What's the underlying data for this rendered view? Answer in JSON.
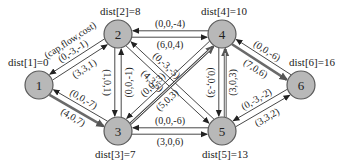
{
  "legend": {
    "label": "(cap,flow,cost)"
  },
  "nodes": [
    {
      "id": "1",
      "label": "1",
      "x": 39,
      "y": 85,
      "dist": "dist[1]=0",
      "dist_x": 8,
      "dist_y": 66
    },
    {
      "id": "2",
      "label": "2",
      "x": 118,
      "y": 34,
      "dist": "dist[2]=8",
      "dist_x": 100,
      "dist_y": 15
    },
    {
      "id": "3",
      "label": "3",
      "x": 118,
      "y": 131,
      "dist": "dist[3]=7",
      "dist_x": 95,
      "dist_y": 158
    },
    {
      "id": "4",
      "label": "4",
      "x": 222,
      "y": 34,
      "dist": "dist[4]=10",
      "dist_x": 201,
      "dist_y": 15
    },
    {
      "id": "5",
      "label": "5",
      "x": 222,
      "y": 131,
      "dist": "dist[5]=13",
      "dist_x": 202,
      "dist_y": 158
    },
    {
      "id": "6",
      "label": "6",
      "x": 301,
      "y": 85,
      "dist": "dist[6]=16",
      "dist_x": 289,
      "dist_y": 66
    }
  ],
  "edges": [
    {
      "from": "1",
      "to": "2",
      "label": "(3,3,1)",
      "style": "thin"
    },
    {
      "from": "2",
      "to": "1",
      "label": "(0,-3,-1)",
      "style": "thin"
    },
    {
      "from": "1",
      "to": "3",
      "label": "(4,0,7)",
      "style": "thick"
    },
    {
      "from": "3",
      "to": "1",
      "label": "(0,0,-7)",
      "style": "thin"
    },
    {
      "from": "2",
      "to": "4",
      "label": "(6,0,4)",
      "style": "thin"
    },
    {
      "from": "4",
      "to": "2",
      "label": "(0,0,-4)",
      "style": "thin"
    },
    {
      "from": "2",
      "to": "3",
      "label": "(1,0,1)",
      "style": "thin"
    },
    {
      "from": "3",
      "to": "2",
      "label": "(0,0,-1)",
      "style": "thin"
    },
    {
      "from": "2",
      "to": "5",
      "label": "(4,3,5)",
      "style": "thin"
    },
    {
      "from": "5",
      "to": "2",
      "label": "(0,-3,-5)",
      "style": "thin"
    },
    {
      "from": "3",
      "to": "4",
      "label": "(5,0,3)",
      "style": "hollow"
    },
    {
      "from": "4",
      "to": "3",
      "label": "(0,0,-3)",
      "style": "thin"
    },
    {
      "from": "3",
      "to": "5",
      "label": "(3,0,6)",
      "style": "thin"
    },
    {
      "from": "5",
      "to": "3",
      "label": "(0,0,-6)",
      "style": "thin"
    },
    {
      "from": "5",
      "to": "4",
      "label": "(3,0,3)",
      "style": "hollow"
    },
    {
      "from": "4",
      "to": "5",
      "label": "(0,0,-3)",
      "style": "thin"
    },
    {
      "from": "4",
      "to": "6",
      "label": "(7,0,6)",
      "style": "thick"
    },
    {
      "from": "6",
      "to": "4",
      "label": "(0,0,-6)",
      "style": "thin"
    },
    {
      "from": "5",
      "to": "6",
      "label": "(3,3,2)",
      "style": "thin"
    },
    {
      "from": "6",
      "to": "5",
      "label": "(0,-3,-2)",
      "style": "thin"
    }
  ],
  "colors": {
    "node_fill": "#b8b8b8",
    "node_stroke": "#5a5a5a",
    "edge": "#333333",
    "thick_edge": "#6a6a6a"
  }
}
